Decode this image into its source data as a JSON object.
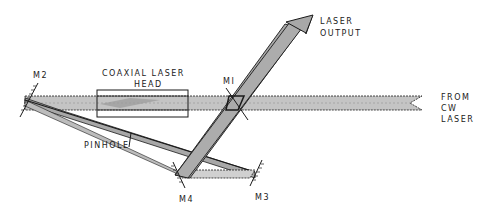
{
  "diagram": {
    "labels": {
      "m1": "MI",
      "m2": "M2",
      "m3": "M3",
      "m4": "M4",
      "head_line1": "COAXIAL LASER",
      "head_line2": "HEAD",
      "pinhole": "PINHOLE",
      "output_line1": "LASER",
      "output_line2": "OUTPUT",
      "input_line1": "FROM",
      "input_line2": "CW",
      "input_line3": "LASER"
    },
    "colors": {
      "beam": "#b8b8b8",
      "line": "#1a1a1a",
      "background": "#ffffff"
    }
  }
}
